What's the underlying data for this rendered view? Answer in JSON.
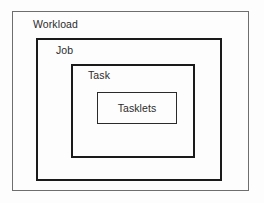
{
  "diagram": {
    "type": "nested-containment",
    "background_color": "#fdfdfd",
    "levels": [
      {
        "id": "workload",
        "label": "Workload",
        "depth": 1,
        "label_position": "top-left",
        "border_color": "#6e6e6e",
        "border_width_px": 1,
        "bounds": {
          "x": 12,
          "y": 11,
          "width": 237,
          "height": 180
        }
      },
      {
        "id": "job",
        "label": "Job",
        "depth": 2,
        "label_position": "top-left",
        "border_color": "#1a1a1a",
        "border_width_px": 2,
        "bounds": {
          "x": 36,
          "y": 38,
          "width": 186,
          "height": 143
        }
      },
      {
        "id": "task",
        "label": "Task",
        "depth": 3,
        "label_position": "top-left",
        "border_color": "#1a1a1a",
        "border_width_px": 2,
        "bounds": {
          "x": 71,
          "y": 64,
          "width": 124,
          "height": 94
        }
      },
      {
        "id": "tasklets",
        "label": "Tasklets",
        "depth": 4,
        "label_position": "center",
        "border_color": "#2a2a2a",
        "border_width_px": 1,
        "bounds": {
          "x": 97,
          "y": 92,
          "width": 80,
          "height": 32
        }
      }
    ]
  }
}
